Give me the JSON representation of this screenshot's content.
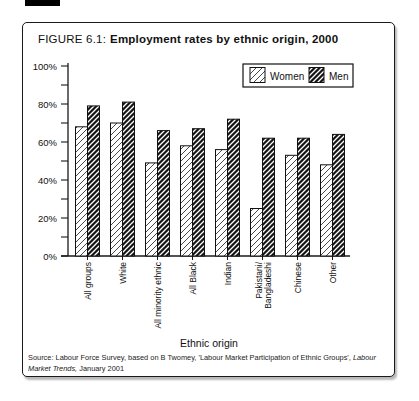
{
  "figure": {
    "label": "FIGURE 6.1:",
    "title": "Employment rates by ethnic origin, 2000"
  },
  "source": {
    "prefix": "Source: Labour Force Survey, based on B Twomey, 'Labour Market Participation of Ethnic Groups', ",
    "italic": "Labour Market Trends,",
    "suffix": " January 2001"
  },
  "chart_data": {
    "type": "bar",
    "title": "Employment rates by ethnic origin, 2000",
    "categories": [
      "All groups",
      "White",
      "All minority ethnic",
      "All Black",
      "Indian",
      "Pakistani/\nBangladeshi",
      "Chinese",
      "Other"
    ],
    "series": [
      {
        "name": "Women",
        "values": [
          68,
          70,
          49,
          58,
          56,
          25,
          53,
          48
        ],
        "style": "light-diagonal-hatch"
      },
      {
        "name": "Men",
        "values": [
          79,
          81,
          66,
          67,
          72,
          62,
          62,
          64
        ],
        "style": "dense-diagonal-hatch"
      }
    ],
    "xlabel": "Ethnic origin",
    "ylabel": "",
    "ylim": [
      0,
      100
    ],
    "ytick_minor_step": 10,
    "yticks_labels": [
      "0%",
      "20%",
      "40%",
      "60%",
      "80%",
      "100%"
    ],
    "grid": false,
    "legend_position": "top-right",
    "colors": {
      "axis": "#1a1a1a",
      "women_fill": "#ffffff",
      "men_fill": "#141414",
      "hatch_line": "#1a1a1a",
      "text": "#111111"
    }
  }
}
